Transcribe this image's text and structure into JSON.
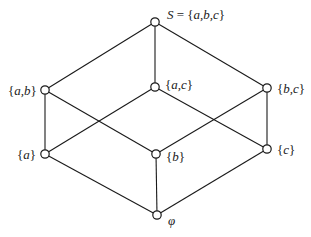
{
  "diagram": {
    "type": "hasse-diagram",
    "colors": {
      "line": "#1a1a1a",
      "node_fill": "#ffffff",
      "background": "#ffffff"
    },
    "nodes": [
      {
        "id": "abc",
        "label": "S = {a,b,c}",
        "x": 155,
        "y": 22,
        "label_x": 167,
        "label_y": 8
      },
      {
        "id": "ab",
        "label": "{a,b}",
        "x": 45,
        "y": 90,
        "label_x": 8,
        "label_y": 84
      },
      {
        "id": "ac",
        "label": "{a,c}",
        "x": 155,
        "y": 87,
        "label_x": 165,
        "label_y": 78
      },
      {
        "id": "bc",
        "label": "{b,c}",
        "x": 267,
        "y": 88,
        "label_x": 277,
        "label_y": 82
      },
      {
        "id": "a",
        "label": "{a}",
        "x": 45,
        "y": 154,
        "label_x": 17,
        "label_y": 148
      },
      {
        "id": "b",
        "label": "{b}",
        "x": 156,
        "y": 154,
        "label_x": 166,
        "label_y": 150
      },
      {
        "id": "c",
        "label": "{c}",
        "x": 267,
        "y": 149,
        "label_x": 277,
        "label_y": 143
      },
      {
        "id": "empty",
        "label": "φ",
        "x": 157,
        "y": 215,
        "label_x": 168,
        "label_y": 214
      }
    ],
    "edges": [
      [
        "abc",
        "ab"
      ],
      [
        "abc",
        "ac"
      ],
      [
        "abc",
        "bc"
      ],
      [
        "ab",
        "a"
      ],
      [
        "ab",
        "b"
      ],
      [
        "ac",
        "a"
      ],
      [
        "ac",
        "c"
      ],
      [
        "bc",
        "b"
      ],
      [
        "bc",
        "c"
      ],
      [
        "a",
        "empty"
      ],
      [
        "b",
        "empty"
      ],
      [
        "c",
        "empty"
      ]
    ]
  },
  "labels": {
    "abc": "S = {a,b,c}",
    "ab": "{a,b}",
    "ac": "{a,c}",
    "bc": "{b,c}",
    "a": "{a}",
    "b": "{b}",
    "c": "{c}",
    "empty": "φ"
  }
}
